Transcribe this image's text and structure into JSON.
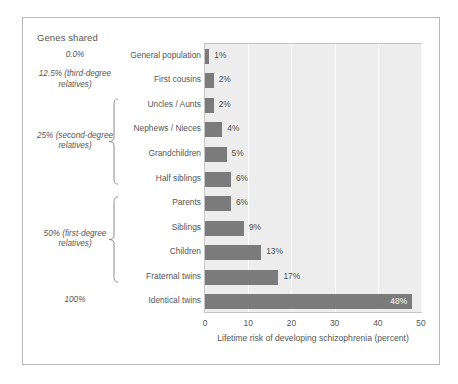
{
  "figure": {
    "genes_shared_header": "Genes shared",
    "axis_title": "Lifetime risk of developing schizophrenia (percent)"
  },
  "gene_groups": [
    {
      "label": "0.0%",
      "rows": [
        0,
        0
      ]
    },
    {
      "label": "12.5% (third-degree relatives)",
      "rows": [
        1,
        1
      ]
    },
    {
      "label": "25% (second-degree relatives)",
      "rows": [
        2,
        5
      ],
      "brace": true
    },
    {
      "label": "50% (first-degree relatives)",
      "rows": [
        6,
        9
      ],
      "brace": true
    },
    {
      "label": "100%",
      "rows": [
        10,
        10
      ]
    }
  ],
  "chart_data": {
    "type": "bar",
    "orientation": "horizontal",
    "title": "",
    "xlabel": "Lifetime risk of developing schizophrenia (percent)",
    "ylabel": "",
    "xlim": [
      0,
      50
    ],
    "xticks": [
      0,
      10,
      20,
      30,
      40,
      50
    ],
    "xtick_labels": [
      "0",
      "10",
      "20",
      "30",
      "40",
      "50"
    ],
    "grid": "vertical",
    "legend": "none",
    "bar_color": "#7b7b7b",
    "plot_background": "#ededed",
    "categories": [
      "General population",
      "First cousins",
      "Uncles / Aunts",
      "Nephews / Nieces",
      "Grandchildren",
      "Half siblings",
      "Parents",
      "Siblings",
      "Children",
      "Fraternal twins",
      "Identical twins"
    ],
    "values": [
      1,
      2,
      2,
      4,
      5,
      6,
      6,
      9,
      13,
      17,
      48
    ],
    "value_labels": [
      "1%",
      "2%",
      "2%",
      "4%",
      "5%",
      "6%",
      "6%",
      "9%",
      "13%",
      "17%",
      "48%"
    ],
    "genes_shared": [
      "0.0%",
      "12.5% (third-degree relatives)",
      "25% (second-degree relatives)",
      "25% (second-degree relatives)",
      "25% (second-degree relatives)",
      "25% (second-degree relatives)",
      "50% (first-degree relatives)",
      "50% (first-degree relatives)",
      "50% (first-degree relatives)",
      "50% (first-degree relatives)",
      "100%"
    ]
  }
}
